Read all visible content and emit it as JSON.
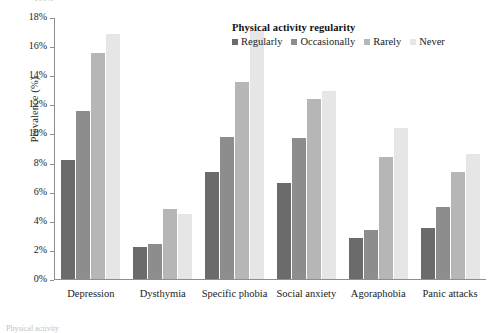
{
  "clipped": {
    "top_fragment": "100%",
    "bottom_fragment": "Physical activity"
  },
  "legend": {
    "title": "Physical activity regularity",
    "items": [
      {
        "label": "Regularly",
        "color": "#6b6b6b"
      },
      {
        "label": "Occasionally",
        "color": "#8d8d8d"
      },
      {
        "label": "Rarely",
        "color": "#b6b6b6"
      },
      {
        "label": "Never",
        "color": "#e6e6e6"
      }
    ]
  },
  "chart_data": {
    "type": "bar",
    "title": "",
    "xlabel": "",
    "ylabel": "Prevalence (%)",
    "ylim": [
      0,
      18
    ],
    "ytick_labels": [
      "0%",
      "2%",
      "4%",
      "6%",
      "8%",
      "10%",
      "12%",
      "14%",
      "16%",
      "18%"
    ],
    "ytick_values": [
      0,
      2,
      4,
      6,
      8,
      10,
      12,
      14,
      16,
      18
    ],
    "grid": false,
    "legend_position": "top-right",
    "categories": [
      "Depression",
      "Dysthymia",
      "Specific phobia",
      "Social anxiety",
      "Agoraphobia",
      "Panic attacks"
    ],
    "series": [
      {
        "name": "Regularly",
        "color": "#6b6b6b",
        "values": [
          8.2,
          2.2,
          7.4,
          6.6,
          2.8,
          3.5
        ]
      },
      {
        "name": "Occasionally",
        "color": "#8d8d8d",
        "values": [
          11.6,
          2.4,
          9.8,
          9.7,
          3.4,
          5.0
        ]
      },
      {
        "name": "Rarely",
        "color": "#b6b6b6",
        "values": [
          15.6,
          4.8,
          13.6,
          12.4,
          8.4,
          7.4
        ]
      },
      {
        "name": "Never",
        "color": "#e6e6e6",
        "values": [
          16.9,
          4.5,
          17.2,
          13.0,
          10.4,
          8.6
        ]
      }
    ]
  }
}
